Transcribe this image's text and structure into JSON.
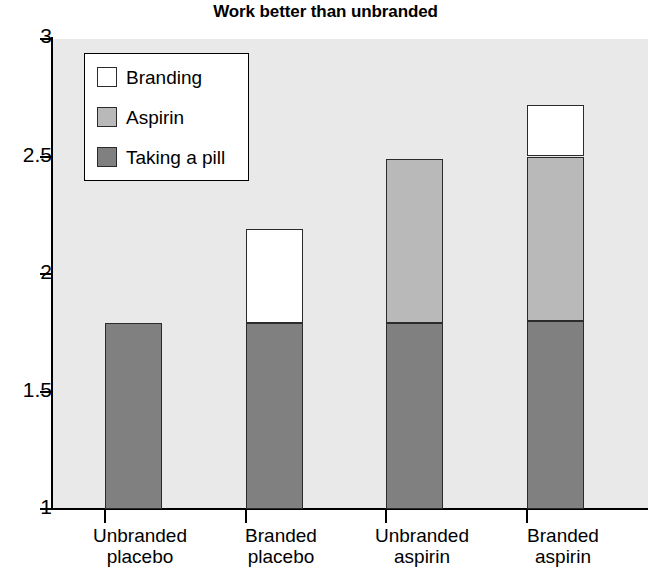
{
  "chart_data": {
    "type": "bar",
    "title": "Work better than unbranded",
    "xlabel": "",
    "ylabel": "",
    "stacked": true,
    "grid": false,
    "legend_position": "upper-left-inside",
    "ylim": [
      1,
      3
    ],
    "yticks": [
      1,
      1.5,
      2,
      2.5,
      3
    ],
    "ytick_labels": [
      "1",
      "1.5",
      "2",
      "2.5",
      "3"
    ],
    "categories": [
      "Unbranded placebo",
      "Branded placebo",
      "Unbranded aspirin",
      "Branded aspirin"
    ],
    "category_lines": [
      [
        "Unbranded",
        "placebo"
      ],
      [
        "Branded",
        "placebo"
      ],
      [
        "Unbranded",
        "aspirin"
      ],
      [
        "Branded",
        "aspirin"
      ]
    ],
    "series": [
      {
        "name": "Taking a pill",
        "color": "#808080",
        "values": [
          1.79,
          1.79,
          1.79,
          1.8
        ],
        "tops": [
          1.79,
          1.79,
          1.79,
          1.8
        ],
        "bottoms": [
          1.0,
          1.0,
          1.0,
          1.0
        ]
      },
      {
        "name": "Aspirin",
        "color": "#b9b9b9",
        "values": [
          0,
          0,
          0.7,
          0.7
        ],
        "tops": [
          1.79,
          1.79,
          2.49,
          2.5
        ],
        "bottoms": [
          1.79,
          1.79,
          1.79,
          1.8
        ]
      },
      {
        "name": "Branding",
        "color": "#ffffff",
        "values": [
          0,
          0.4,
          0,
          0.22
        ],
        "tops": [
          1.79,
          2.19,
          2.49,
          2.72
        ],
        "bottoms": [
          1.79,
          1.79,
          2.49,
          2.5
        ]
      }
    ],
    "bar_totals": [
      1.79,
      2.19,
      2.49,
      2.72
    ],
    "legend_entries": [
      {
        "label": "Branding",
        "color": "#ffffff"
      },
      {
        "label": "Aspirin",
        "color": "#b9b9b9"
      },
      {
        "label": "Taking a pill",
        "color": "#808080"
      }
    ],
    "colors": {
      "plot_background": "#e9e9e9",
      "page_background": "#ffffff",
      "axis": "#000000",
      "bar_outline": "#2b2b2b",
      "branding": "#ffffff",
      "aspirin": "#b9b9b9",
      "taking_a_pill": "#808080"
    }
  }
}
